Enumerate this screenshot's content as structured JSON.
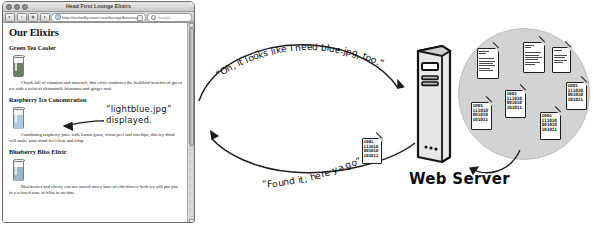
{
  "browser": {
    "window_title": "Head First Lounge Elixirs",
    "url": "http://wickedlysmart.com/lounge/beverages/elixir.html",
    "search_placeholder": "Google",
    "nav": {
      "back": "Back",
      "forward": "Forward",
      "stop": "Stop",
      "home": "Home"
    },
    "page": {
      "heading": "Our Elixirs",
      "sections": [
        {
          "title": "Green Tea Cooler",
          "body": "Chock full of vitamins and minerals, this elixir combines the healthful benefits of green tea with a twist of chamomile blossoms and ginger root.",
          "glass_color": "#6b7f63"
        },
        {
          "title": "Raspberry Ice Concentration",
          "body": "Combining raspberry juice with lemon grass, citrus peel and rosehips, this icy drink will make your mind feel clear and crisp.",
          "glass_color": "#aecbe4"
        },
        {
          "title": "Blueberry Bliss Elixir",
          "body": "Blueberries and cherry essence mixed into a base of elderflower herb tea will put you in a relaxed state of bliss in no time.",
          "glass_color": "#9fb6cf"
        }
      ]
    }
  },
  "annotations": {
    "lightblue_callout_line1": "“lightblue.jpg”",
    "lightblue_callout_line2": "displayed.",
    "request_message": "“Oh, it looks like I need blue.jpg, too.”",
    "response_message": "“Found it; here ya go”"
  },
  "server": {
    "label": "Web Server",
    "files": [
      {
        "kind": "html",
        "binary": ""
      },
      {
        "kind": "html",
        "binary": ""
      },
      {
        "kind": "html",
        "binary": ""
      },
      {
        "kind": "image",
        "binary": "1001\n111010\n001010\n101011"
      },
      {
        "kind": "image",
        "binary": "1001\n111010\n001010\n101011"
      },
      {
        "kind": "image",
        "binary": "1001\n111010\n001010\n101011"
      },
      {
        "kind": "image",
        "binary": "1001\n111010\n001010\n101011"
      }
    ],
    "inflight_file": {
      "kind": "image",
      "binary": "1001\n111010\n001010\n101011"
    }
  },
  "colors": {
    "disk_gray": "#d3d3d3",
    "ink": "#121212",
    "paper": "#ffffff"
  }
}
